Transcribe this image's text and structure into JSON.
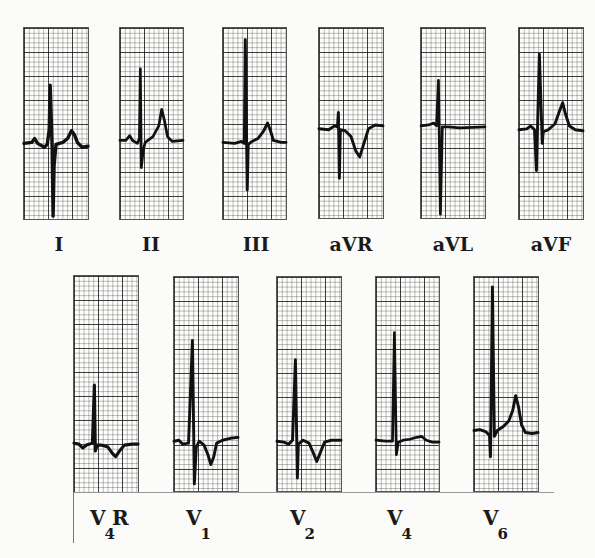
{
  "figure": {
    "type": "12-lead electrocardiogram panel",
    "rows": [
      {
        "name": "limb-leads",
        "leads": [
          {
            "id": "I",
            "label": "I"
          },
          {
            "id": "II",
            "label": "II"
          },
          {
            "id": "III",
            "label": "III"
          },
          {
            "id": "aVR",
            "label": "aVR"
          },
          {
            "id": "aVL",
            "label": "aVL"
          },
          {
            "id": "aVF",
            "label": "aVF"
          }
        ]
      },
      {
        "name": "precordial-leads",
        "leads": [
          {
            "id": "V4R",
            "label_main": "V",
            "label_sub": "4",
            "label_suffix": "R"
          },
          {
            "id": "V1",
            "label_main": "V",
            "label_sub": "1",
            "label_suffix": ""
          },
          {
            "id": "V2",
            "label_main": "V",
            "label_sub": "2",
            "label_suffix": ""
          },
          {
            "id": "V4",
            "label_main": "V",
            "label_sub": "4",
            "label_suffix": ""
          },
          {
            "id": "V6",
            "label_main": "V",
            "label_sub": "6",
            "label_suffix": ""
          }
        ]
      }
    ],
    "colors": {
      "background": "#fbfbf9",
      "trace": "#111111",
      "grid_major": "#222222",
      "grid_minor": "#777777"
    }
  }
}
